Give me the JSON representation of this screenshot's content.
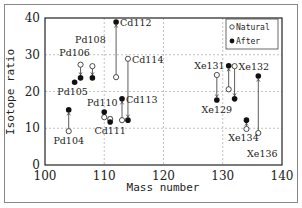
{
  "chart_data": {
    "type": "scatter",
    "title": "",
    "xlabel": "Mass number",
    "ylabel": "Isotope ratio",
    "xlim": [
      100,
      140
    ],
    "ylim": [
      0,
      40
    ],
    "xticks": [
      100,
      110,
      120,
      130,
      140
    ],
    "yticks": [
      0,
      10,
      20,
      30,
      40
    ],
    "grid": true,
    "legend": {
      "placement": "top-right",
      "entries": [
        {
          "name": "Natural",
          "marker": "open-circle"
        },
        {
          "name": "After",
          "marker": "filled-circle"
        }
      ]
    },
    "series": [
      {
        "name": "Natural",
        "marker": "open-circle"
      },
      {
        "name": "After",
        "marker": "filled-circle"
      }
    ],
    "points": [
      {
        "label": "Pd104",
        "x": 104,
        "natural": 9.2,
        "after": 15.0,
        "label_pos": "below"
      },
      {
        "label": "Pd105",
        "x": 105,
        "natural": null,
        "after": 22.5,
        "label_pos": "below-left"
      },
      {
        "label": "Pd106",
        "x": 106,
        "natural": 27.3,
        "after": 23.7,
        "label_pos": "above-left"
      },
      {
        "label": "Pd108",
        "x": 108,
        "natural": 26.9,
        "after": 23.7,
        "label_pos": "above"
      },
      {
        "label": "Pd110",
        "x": 110,
        "natural": 13.0,
        "after": 14.4,
        "label_pos": "above"
      },
      {
        "label": "Cd111",
        "x": 111,
        "natural": 12.5,
        "after": 11.7,
        "label_pos": "below"
      },
      {
        "label": "Cd112",
        "x": 112,
        "natural": 23.9,
        "after": 38.9,
        "label_pos": "right"
      },
      {
        "label": "Cd113",
        "x": 113,
        "natural": 12.2,
        "after": 18.0,
        "label_pos": "right"
      },
      {
        "label": "Cd114",
        "x": 114,
        "natural": 28.9,
        "after": 12.2,
        "label_pos": "right"
      },
      {
        "label": "Xe129",
        "x": 129,
        "natural": 24.5,
        "after": 17.7,
        "label_pos": "below"
      },
      {
        "label": "Xe131",
        "x": 131,
        "natural": 20.6,
        "after": 27.0,
        "label_pos": "left"
      },
      {
        "label": "Xe132",
        "x": 132,
        "natural": 26.9,
        "after": 18.0,
        "label_pos": "right"
      },
      {
        "label": "Xe134",
        "x": 134,
        "natural": 9.8,
        "after": 12.2,
        "label_pos": "below"
      },
      {
        "label": "Xe136",
        "x": 136,
        "natural": 8.7,
        "after": 24.2,
        "label_pos": "below"
      }
    ]
  }
}
